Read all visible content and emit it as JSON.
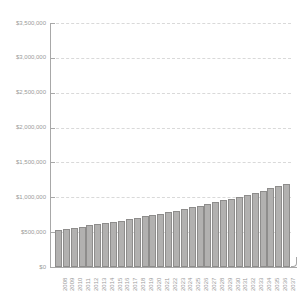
{
  "chart_data": {
    "type": "bar",
    "title": "",
    "xlabel": "",
    "ylabel": "",
    "categories": [
      "2008",
      "2009",
      "2010",
      "2011",
      "2012",
      "2013",
      "2014",
      "2015",
      "2016",
      "2017",
      "2018",
      "2019",
      "2020",
      "2021",
      "2022",
      "2023",
      "2024",
      "2025",
      "2026",
      "2027",
      "2028",
      "2029",
      "2030",
      "2031",
      "2032",
      "2033",
      "2034",
      "2035",
      "2036",
      "2037"
    ],
    "values": [
      535000,
      550000,
      565000,
      581000,
      597000,
      614000,
      631000,
      649000,
      667000,
      686000,
      705000,
      725000,
      745000,
      766000,
      788000,
      810000,
      832000,
      856000,
      879000,
      904000,
      929000,
      955000,
      982000,
      1010000,
      1038000,
      1067000,
      1097000,
      1128000,
      1159000,
      1192000
    ],
    "ylim": [
      0,
      3500000
    ],
    "ytick_values": [
      0,
      500000,
      1000000,
      1500000,
      2000000,
      2500000,
      3000000,
      3500000
    ],
    "ytick_labels": [
      "$0",
      "$500,000",
      "$1,000,000",
      "$1,500,000",
      "$2,000,000",
      "$2,500,000",
      "$3,000,000",
      "$3,500,000"
    ],
    "grid": "horizontal-dashed",
    "legend": "none",
    "colors": {
      "bar_fill": "#b2b1b0",
      "bar_border": "#8e8d8c",
      "axis": "#a8a8a8",
      "gridline": "#d9d9d9",
      "labels": "#9a9a9a",
      "background": "#ffffff"
    }
  }
}
